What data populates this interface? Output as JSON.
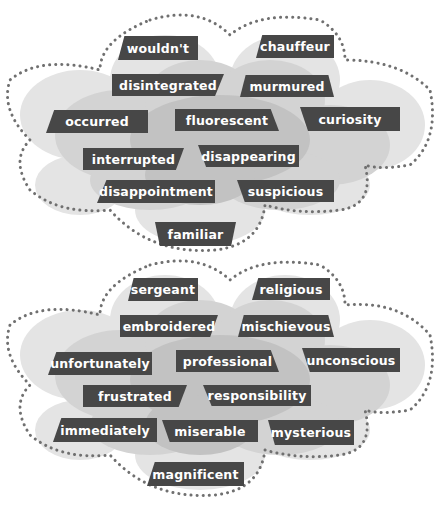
{
  "colors": {
    "tag_fill": "#474747",
    "tag_text": "#ffffff",
    "cloud_light": "#e6e6e6",
    "cloud_mid": "#d2d2d2",
    "cloud_dark": "#bdbdbd",
    "dots": "#707070",
    "background": "#ffffff"
  },
  "clouds": [
    {
      "name": "top-cloud",
      "words": [
        {
          "text": "wouldn't"
        },
        {
          "text": "chauffeur"
        },
        {
          "text": "disintegrated"
        },
        {
          "text": "murmured"
        },
        {
          "text": "occurred"
        },
        {
          "text": "fluorescent"
        },
        {
          "text": "curiosity"
        },
        {
          "text": "interrupted"
        },
        {
          "text": "disappearing"
        },
        {
          "text": "disappointment"
        },
        {
          "text": "suspicious"
        },
        {
          "text": "familiar"
        }
      ]
    },
    {
      "name": "bottom-cloud",
      "words": [
        {
          "text": "sergeant"
        },
        {
          "text": "religious"
        },
        {
          "text": "embroidered"
        },
        {
          "text": "mischievous"
        },
        {
          "text": "unfortunately"
        },
        {
          "text": "professional"
        },
        {
          "text": "unconscious"
        },
        {
          "text": "frustrated"
        },
        {
          "text": "responsibility"
        },
        {
          "text": "immediately"
        },
        {
          "text": "miserable"
        },
        {
          "text": "mysterious"
        },
        {
          "text": "magnificent"
        }
      ]
    }
  ]
}
